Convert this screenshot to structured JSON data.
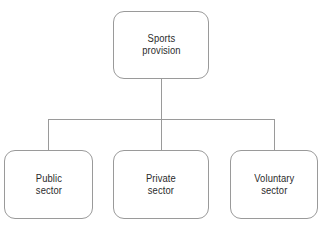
{
  "diagram": {
    "type": "organizational-tree",
    "orientation": "top-down",
    "line_color": "#9a9a9a",
    "text_color": "#2b2b2b",
    "background_color": "#ffffff",
    "root": {
      "id": "root",
      "label": "Sports\nprovision"
    },
    "children": [
      {
        "id": "public",
        "label": "Public\nsector"
      },
      {
        "id": "private",
        "label": "Private\nsector"
      },
      {
        "id": "voluntary",
        "label": "Voluntary\nsector"
      }
    ]
  }
}
